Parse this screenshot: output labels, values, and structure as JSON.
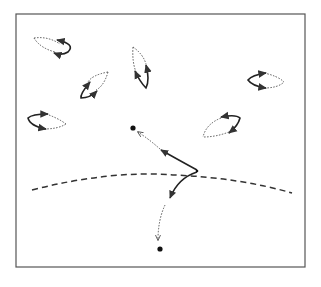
{
  "diagram": {
    "title": "",
    "colors": {
      "stroke": "#333333",
      "frame": "#555555",
      "background": "#ffffff"
    },
    "frame": {
      "x": 16,
      "y": 14,
      "width": 289,
      "height": 253
    },
    "loops": [
      {
        "id": "loop-top-left",
        "cx": 48,
        "cy": 45,
        "rx": 22,
        "ry": 7,
        "angle": 15,
        "solid_side": "right"
      },
      {
        "id": "loop-upper-center",
        "cx": 142,
        "cy": 66,
        "rx": 22,
        "ry": 7,
        "angle": 62,
        "solid_side": "bottom"
      },
      {
        "id": "loop-mid-left",
        "cx": 94,
        "cy": 82,
        "rx": 22,
        "ry": 7,
        "angle": -45,
        "solid_side": "bottom-left"
      },
      {
        "id": "loop-right",
        "cx": 266,
        "cy": 80,
        "rx": 20,
        "ry": 7,
        "angle": 8,
        "solid_side": "left"
      },
      {
        "id": "loop-lower-left",
        "cx": 46,
        "cy": 122,
        "rx": 20,
        "ry": 7,
        "angle": 12,
        "solid_side": "left"
      },
      {
        "id": "loop-lower-right",
        "cx": 222,
        "cy": 125,
        "rx": 21,
        "ry": 7,
        "angle": -40,
        "solid_side": "top-right"
      }
    ],
    "points": [
      {
        "id": "point-upper",
        "x": 133,
        "y": 128
      },
      {
        "id": "point-lower",
        "x": 160,
        "y": 249
      },
      {
        "id": "point-junction",
        "x": 197,
        "y": 170
      }
    ],
    "boundary": {
      "style": "dashed",
      "label": ""
    }
  }
}
